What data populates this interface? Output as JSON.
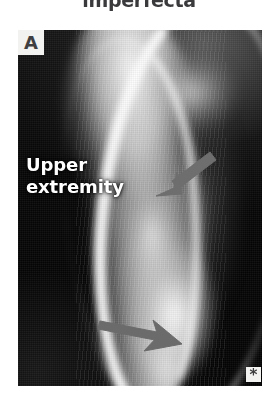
{
  "figure": {
    "heading": "imperfecta",
    "panel_label": "A",
    "annotation_label": "Upper\nextremity",
    "corner_marker": "*",
    "modality": "radiograph",
    "arrows": [
      {
        "name": "upper-arrow",
        "direction": "down-left",
        "color": "#6e6e6e"
      },
      {
        "name": "lower-arrow",
        "direction": "right-down",
        "color": "#6b6b6b"
      }
    ],
    "colors": {
      "page_background": "#ffffff",
      "heading_text": "#3a3a3c",
      "panel_background": "#050505",
      "label_box_background": "#f2f2f0",
      "label_box_text": "#3f3f41",
      "overlay_text": "#ffffff",
      "arrow": "#6e6e6e"
    }
  }
}
